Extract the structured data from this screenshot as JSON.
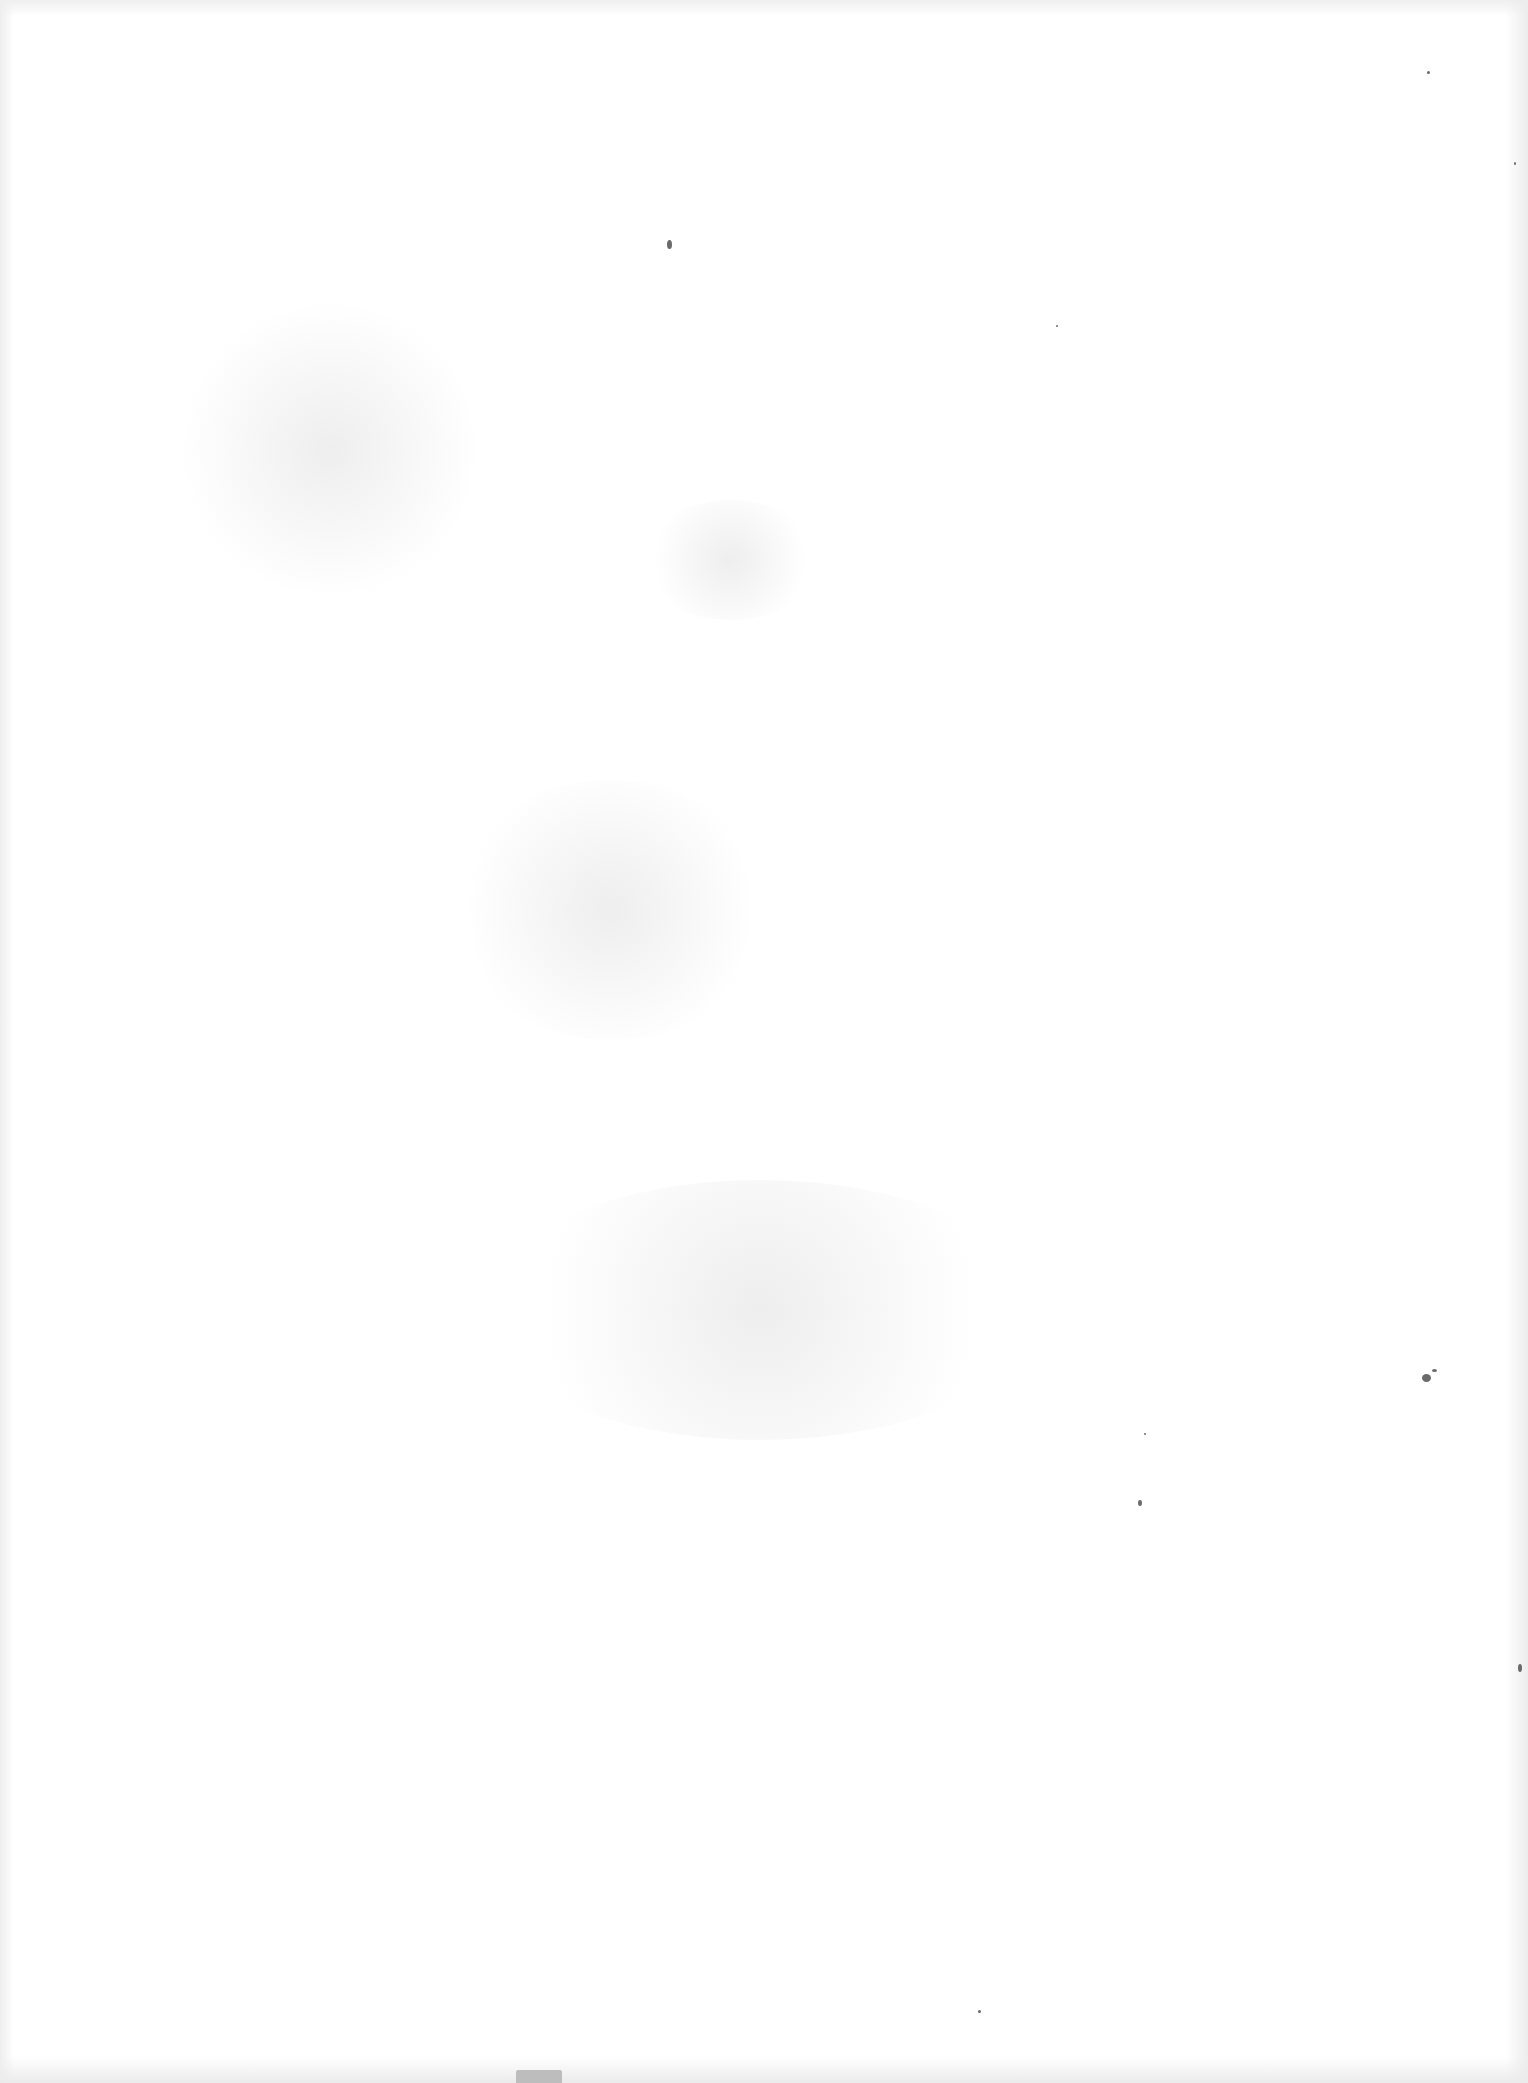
{
  "document": {
    "type": "scanned-page",
    "content": "",
    "is_blank": true,
    "background_color": "#ffffff",
    "edge_shade_color": "#ececec"
  },
  "artifacts": {
    "specks": [
      {
        "x": 667,
        "y": 240,
        "w": 5,
        "h": 9
      },
      {
        "x": 1422,
        "y": 1374,
        "w": 9,
        "h": 8
      },
      {
        "x": 1432,
        "y": 1369,
        "w": 5,
        "h": 3
      },
      {
        "x": 1138,
        "y": 1500,
        "w": 4,
        "h": 6
      },
      {
        "x": 1427,
        "y": 71,
        "w": 3,
        "h": 3
      },
      {
        "x": 1518,
        "y": 1664,
        "w": 4,
        "h": 8
      },
      {
        "x": 978,
        "y": 2010,
        "w": 3,
        "h": 3
      },
      {
        "x": 1144,
        "y": 1433,
        "w": 2,
        "h": 2
      },
      {
        "x": 1514,
        "y": 162,
        "w": 2,
        "h": 3
      },
      {
        "x": 1056,
        "y": 325,
        "w": 2,
        "h": 2
      }
    ],
    "noise_regions": [
      {
        "x": 180,
        "y": 300,
        "w": 300,
        "h": 300
      },
      {
        "x": 450,
        "y": 780,
        "w": 320,
        "h": 260
      },
      {
        "x": 480,
        "y": 1180,
        "w": 560,
        "h": 260
      },
      {
        "x": 640,
        "y": 500,
        "w": 180,
        "h": 120
      }
    ],
    "binding_mark": {
      "x": 516,
      "y": 2070,
      "w": 46,
      "h": 13
    }
  }
}
